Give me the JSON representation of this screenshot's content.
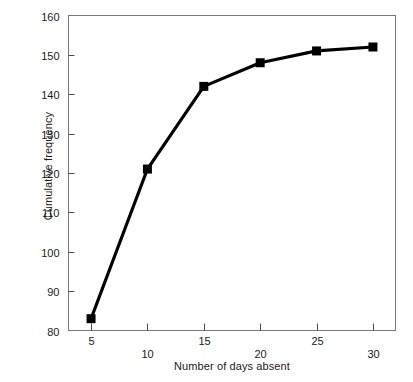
{
  "chart_data": {
    "type": "line",
    "title": "",
    "xlabel": "Number of days absent",
    "ylabel": "Cumulative frequency",
    "x": [
      5,
      10,
      15,
      20,
      25,
      30
    ],
    "values": [
      83,
      121,
      142,
      148,
      151,
      152
    ],
    "series": [
      {
        "name": "Cumulative frequency",
        "x": [
          5,
          10,
          15,
          20,
          25,
          30
        ],
        "values": [
          83,
          121,
          142,
          148,
          151,
          152
        ]
      }
    ],
    "xlim": [
      3,
      32
    ],
    "ylim": [
      80,
      160
    ],
    "xticks": [
      5,
      10,
      15,
      20,
      25,
      30
    ],
    "yticks": [
      80,
      90,
      100,
      110,
      120,
      130,
      140,
      150,
      160
    ],
    "xtick_labels": [
      "5",
      "10",
      "15",
      "20",
      "25",
      "30"
    ],
    "ytick_labels": [
      "80",
      "90",
      "100",
      "110",
      "120",
      "130",
      "140",
      "150",
      "160"
    ],
    "grid": false,
    "legend": "none",
    "marker": "square",
    "line_color": "#000000",
    "marker_color": "#000000",
    "frame_color": "#7a7a7a",
    "background": "#ffffff"
  },
  "axes": {
    "y_title": "Cumulative frequency",
    "x_title": "Number of days absent",
    "y_ticks": [
      {
        "value": 160,
        "label": "160"
      },
      {
        "value": 150,
        "label": "150"
      },
      {
        "value": 140,
        "label": "140"
      },
      {
        "value": 130,
        "label": "130"
      },
      {
        "value": 120,
        "label": "120"
      },
      {
        "value": 110,
        "label": "110"
      },
      {
        "value": 100,
        "label": "100"
      },
      {
        "value": 90,
        "label": "90"
      },
      {
        "value": 80,
        "label": "80"
      }
    ],
    "x_ticks": [
      {
        "value": 5,
        "label": "5"
      },
      {
        "value": 10,
        "label": "10"
      },
      {
        "value": 15,
        "label": "15"
      },
      {
        "value": 20,
        "label": "20"
      },
      {
        "value": 25,
        "label": "25"
      },
      {
        "value": 30,
        "label": "30"
      }
    ]
  },
  "caption": {
    "text": ""
  }
}
